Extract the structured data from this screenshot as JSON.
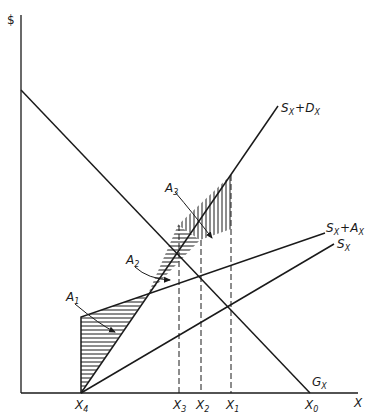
{
  "diagram": {
    "y_axis_label": "$",
    "x_axis_label": "X",
    "curves": {
      "gx": {
        "label": "G",
        "sub": "X"
      },
      "sx_dx": {
        "label": "S",
        "sub": "X",
        "plus": "+",
        "label2": "D",
        "sub2": "X"
      },
      "sx_ax": {
        "label": "S",
        "sub": "X",
        "plus": "+",
        "label2": "A",
        "sub2": "X"
      },
      "sx": {
        "label": "S",
        "sub": "X"
      }
    },
    "x_ticks": [
      {
        "label": "X",
        "sub": "4"
      },
      {
        "label": "X",
        "sub": "3"
      },
      {
        "label": "X",
        "sub": "2"
      },
      {
        "label": "X",
        "sub": "1"
      },
      {
        "label": "X",
        "sub": "0"
      }
    ],
    "areas": [
      {
        "label": "A",
        "sub": "1"
      },
      {
        "label": "A",
        "sub": "2"
      },
      {
        "label": "A",
        "sub": "3"
      }
    ],
    "colors": {
      "ink": "#1a1a1a",
      "background": "#ffffff"
    }
  }
}
